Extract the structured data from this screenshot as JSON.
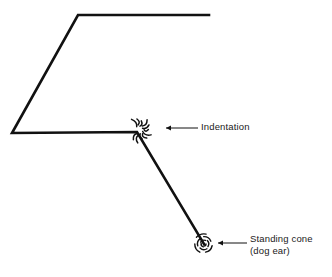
{
  "figure": {
    "type": "technical-line-diagram",
    "background_color": "#ffffff",
    "line_color": "#111111",
    "text_color": "#1a1a1a",
    "width": 332,
    "height": 277
  },
  "workpiece": {
    "name": "bent-sheet-outline",
    "stroke_width": 2.6,
    "vertices": [
      {
        "x": 209,
        "y": 15
      },
      {
        "x": 78,
        "y": 15
      },
      {
        "x": 12,
        "y": 133
      },
      {
        "x": 137,
        "y": 132
      },
      {
        "x": 204,
        "y": 244
      }
    ]
  },
  "defects": [
    {
      "id": "indentation",
      "marker": "starburst-burst",
      "center": {
        "x": 139,
        "y": 130
      },
      "radius_inner": 4,
      "radius_outer": 13,
      "ray_count": 11
    },
    {
      "id": "standing-cone",
      "marker": "spiral-swirl",
      "center": {
        "x": 204,
        "y": 244
      },
      "radius_inner": 2,
      "radius_outer": 11,
      "arc_count": 10
    }
  ],
  "callouts": [
    {
      "id": "indentation-callout",
      "label": "Indentation",
      "leader": {
        "x1": 198,
        "y1": 128,
        "x2": 166,
        "y2": 128
      },
      "arrow_at": {
        "x": 166,
        "y": 128
      },
      "label_position": {
        "x": 201,
        "y": 121
      }
    },
    {
      "id": "standing-cone-callout",
      "label_line1": "Standing cone",
      "label_line2": "(dog ear)",
      "leader": {
        "x1": 247,
        "y1": 243,
        "x2": 218,
        "y2": 243
      },
      "arrow_at": {
        "x": 218,
        "y": 243
      },
      "label_position": {
        "x": 250,
        "y": 233
      }
    }
  ],
  "leader_style": {
    "stroke_width": 1.0,
    "arrow_length": 5,
    "arrow_half_height": 2.4
  }
}
